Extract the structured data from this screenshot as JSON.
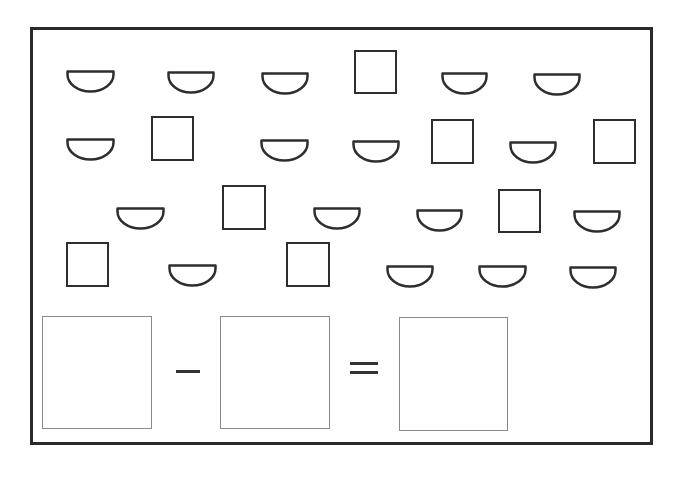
{
  "worksheet": {
    "title": "",
    "task": "count-and-subtract",
    "shape_types": [
      "semicircle",
      "square"
    ],
    "counts": {
      "semicircle": 18,
      "square": 8,
      "total": 26
    },
    "equation": {
      "operator_1": "−",
      "operator_2": "=",
      "box_1_value": "",
      "box_2_value": "",
      "box_3_value": ""
    },
    "colors": {
      "stroke": "#2e2e2e",
      "answer_box_border": "#8a8a8a",
      "background": "#ffffff"
    },
    "shapes": [
      {
        "type": "semicircle",
        "x": 66,
        "y": 70,
        "w": 49,
        "h": 23
      },
      {
        "type": "semicircle",
        "x": 167,
        "y": 71,
        "w": 48,
        "h": 23
      },
      {
        "type": "semicircle",
        "x": 261,
        "y": 72,
        "w": 48,
        "h": 23
      },
      {
        "type": "square",
        "x": 354,
        "y": 50,
        "w": 43,
        "h": 44
      },
      {
        "type": "semicircle",
        "x": 441,
        "y": 72,
        "w": 47,
        "h": 23
      },
      {
        "type": "semicircle",
        "x": 533,
        "y": 73,
        "w": 48,
        "h": 23
      },
      {
        "type": "semicircle",
        "x": 66,
        "y": 138,
        "w": 49,
        "h": 23
      },
      {
        "type": "square",
        "x": 151,
        "y": 116,
        "w": 43,
        "h": 45
      },
      {
        "type": "semicircle",
        "x": 260,
        "y": 139,
        "w": 49,
        "h": 23
      },
      {
        "type": "semicircle",
        "x": 352,
        "y": 140,
        "w": 48,
        "h": 23
      },
      {
        "type": "square",
        "x": 431,
        "y": 119,
        "w": 43,
        "h": 45
      },
      {
        "type": "semicircle",
        "x": 509,
        "y": 141,
        "w": 48,
        "h": 23
      },
      {
        "type": "square",
        "x": 593,
        "y": 119,
        "w": 43,
        "h": 45
      },
      {
        "type": "semicircle",
        "x": 116,
        "y": 207,
        "w": 49,
        "h": 23
      },
      {
        "type": "square",
        "x": 222,
        "y": 185,
        "w": 44,
        "h": 45
      },
      {
        "type": "semicircle",
        "x": 313,
        "y": 207,
        "w": 48,
        "h": 23
      },
      {
        "type": "semicircle",
        "x": 416,
        "y": 209,
        "w": 47,
        "h": 23
      },
      {
        "type": "square",
        "x": 498,
        "y": 189,
        "w": 43,
        "h": 44
      },
      {
        "type": "semicircle",
        "x": 573,
        "y": 210,
        "w": 48,
        "h": 23
      },
      {
        "type": "square",
        "x": 66,
        "y": 242,
        "w": 43,
        "h": 45
      },
      {
        "type": "semicircle",
        "x": 168,
        "y": 264,
        "w": 49,
        "h": 23
      },
      {
        "type": "square",
        "x": 286,
        "y": 242,
        "w": 44,
        "h": 45
      },
      {
        "type": "semicircle",
        "x": 386,
        "y": 265,
        "w": 48,
        "h": 23
      },
      {
        "type": "semicircle",
        "x": 478,
        "y": 265,
        "w": 49,
        "h": 23
      },
      {
        "type": "semicircle",
        "x": 569,
        "y": 266,
        "w": 48,
        "h": 23
      }
    ]
  }
}
